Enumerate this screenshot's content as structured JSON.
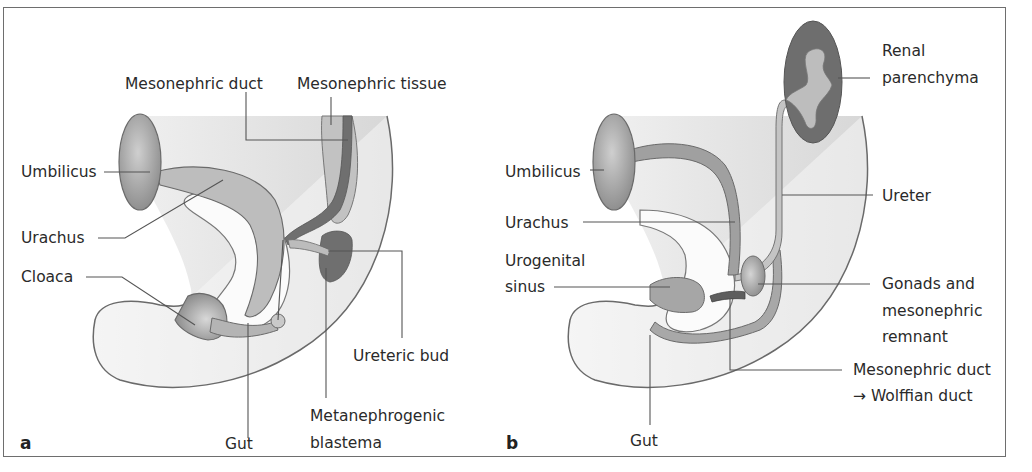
{
  "figure": {
    "panels": [
      {
        "letter": "a",
        "labels": {
          "mesonephric_duct": "Mesonephric duct",
          "mesonephric_tissue": "Mesonephric tissue",
          "umbilicus": "Umbilicus",
          "urachus": "Urachus",
          "cloaca": "Cloaca",
          "ureteric_bud": "Ureteric bud",
          "gut": "Gut",
          "metanephrogenic_1": "Metanephrogenic",
          "metanephrogenic_2": "blastema"
        }
      },
      {
        "letter": "b",
        "labels": {
          "renal_1": "Renal",
          "renal_2": "parenchyma",
          "umbilicus": "Umbilicus",
          "urachus": "Urachus",
          "ureter": "Ureter",
          "urogenital_1": "Urogenital",
          "urogenital_2": "sinus",
          "gonads_1": "Gonads and",
          "gonads_2": "mesonephric",
          "gonads_3": "remnant",
          "meso_duct_1": "Mesonephric duct",
          "meso_duct_2": "→ Wolffian duct",
          "gut": "Gut"
        }
      }
    ],
    "colors": {
      "body_fill": "#e6e6e6",
      "outline": "#6a6a6a",
      "mid_gray": "#a8a8a8",
      "dark_gray": "#6e6e6e",
      "umbilicus": "#9c9c9c"
    }
  }
}
